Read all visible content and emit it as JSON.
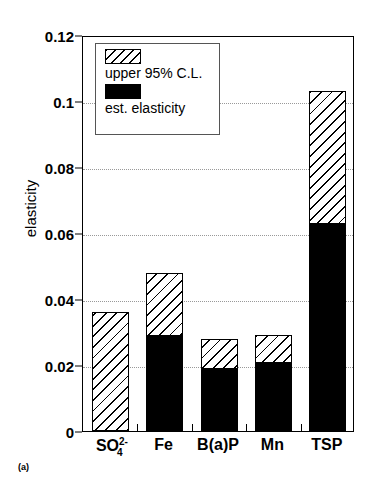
{
  "chart_data": {
    "type": "bar",
    "title": "",
    "subtitle": "",
    "xlabel": "",
    "ylabel": "elasticity",
    "ylim": [
      0,
      0.12
    ],
    "yticks": [
      "0",
      "0.02",
      "0.04",
      "0.06",
      "0.08",
      "0.1",
      "0.12"
    ],
    "ytick_values": [
      0,
      0.02,
      0.04,
      0.06,
      0.08,
      0.1,
      0.12
    ],
    "grid": true,
    "grid_axis": "y",
    "stacked": true,
    "legend_position": "upper left (inside axes)",
    "categories": [
      "SO4^2-",
      "Fe",
      "B(a)P",
      "Mn",
      "TSP"
    ],
    "category_labels_html": [
      "SO",
      "Fe",
      "B(a)P",
      "Mn",
      "TSP"
    ],
    "series": [
      {
        "name": "est. elasticity",
        "style": "solid-black",
        "color": "#000000",
        "values": [
          0.0,
          0.029,
          0.019,
          0.021,
          0.063
        ]
      },
      {
        "name": "upper 95% C.L.",
        "style": "hatched",
        "color": "#ffffff",
        "values": [
          0.036,
          0.048,
          0.028,
          0.029,
          0.103
        ]
      }
    ],
    "annotations": [
      "(a)"
    ]
  },
  "axis": {
    "y_title": "elasticity",
    "ticks": [
      {
        "label": "0.12",
        "value": 0.12
      },
      {
        "label": "0.1",
        "value": 0.1
      },
      {
        "label": "0.08",
        "value": 0.08
      },
      {
        "label": "0.06",
        "value": 0.06
      },
      {
        "label": "0.04",
        "value": 0.04
      },
      {
        "label": "0.02",
        "value": 0.02
      },
      {
        "label": "0",
        "value": 0
      }
    ]
  },
  "categories": [
    {
      "key": "so4",
      "base": "SO",
      "sup": "2-",
      "sub": "4",
      "plain": "SO4 2-"
    },
    {
      "key": "fe",
      "base": "Fe",
      "sup": "",
      "sub": "",
      "plain": "Fe"
    },
    {
      "key": "bap",
      "base": "B(a)P",
      "sup": "",
      "sub": "",
      "plain": "B(a)P"
    },
    {
      "key": "mn",
      "base": "Mn",
      "sup": "",
      "sub": "",
      "plain": "Mn"
    },
    {
      "key": "tsp",
      "base": "TSP",
      "sup": "",
      "sub": "",
      "plain": "TSP"
    }
  ],
  "legend": {
    "upper_label": "upper 95% C.L.",
    "est_label": "est. elasticity"
  },
  "panel": {
    "label": "(a)"
  },
  "colors": {
    "axis": "#000000",
    "grid": "#999999",
    "est_fill": "#000000",
    "upper_fill": "#ffffff",
    "legend_border": "#555555"
  }
}
